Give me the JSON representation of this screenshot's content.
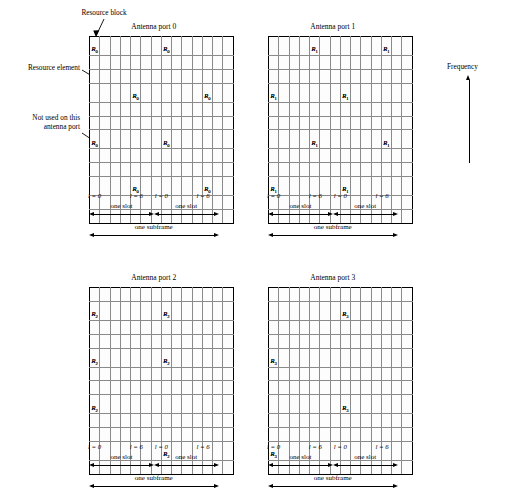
{
  "figure": {
    "type": "lte-resource-grid",
    "panel_count": 4,
    "grid": {
      "columns": 14,
      "rows": 12,
      "slots_per_subframe": 2,
      "symbols_per_slot": 7,
      "subcarriers": 12
    }
  },
  "annotations": {
    "resource_block": "Resource block",
    "resource_element": "Resource element",
    "not_used_line1": "Not used on this",
    "not_used_line2": "antenna port",
    "frequency": "Frequency"
  },
  "axis": {
    "l_zero": "l = 0",
    "l_six": "l = 6",
    "one_slot": "one slot",
    "one_subframe": "one subframe"
  },
  "colors": {
    "grid_line": "#8a8a8a",
    "border": "#000000",
    "hatch_fill": "#e9e9e9",
    "ref_fill": "#d8d8d8"
  },
  "panels": [
    {
      "id": "antenna-port-0",
      "title": "Antenna port 0",
      "ref_symbol": "R",
      "ref_subscript": "0",
      "cells": {
        "ref": [
          {
            "row": 2,
            "col": 0
          },
          {
            "row": 2,
            "col": 4
          },
          {
            "row": 2,
            "col": 7
          },
          {
            "row": 2,
            "col": 11
          },
          {
            "row": 5,
            "col": 0
          },
          {
            "row": 5,
            "col": 4
          },
          {
            "row": 5,
            "col": 7
          },
          {
            "row": 5,
            "col": 11
          },
          {
            "row": 8,
            "col": 0
          },
          {
            "row": 8,
            "col": 4
          },
          {
            "row": 8,
            "col": 7
          },
          {
            "row": 8,
            "col": 11
          },
          {
            "row": 11,
            "col": 0
          },
          {
            "row": 11,
            "col": 4
          },
          {
            "row": 11,
            "col": 7
          },
          {
            "row": 11,
            "col": 11
          }
        ],
        "ref_labeled": [
          {
            "row": 2,
            "col": 4
          },
          {
            "row": 2,
            "col": 11
          },
          {
            "row": 5,
            "col": 0
          },
          {
            "row": 5,
            "col": 7
          },
          {
            "row": 8,
            "col": 4
          },
          {
            "row": 8,
            "col": 11
          },
          {
            "row": 11,
            "col": 0
          },
          {
            "row": 11,
            "col": 7
          }
        ]
      }
    },
    {
      "id": "antenna-port-1",
      "title": "Antenna port 1",
      "ref_symbol": "R",
      "ref_subscript": "1",
      "cells": {
        "ref": [
          {
            "row": 2,
            "col": 0
          },
          {
            "row": 2,
            "col": 4
          },
          {
            "row": 2,
            "col": 7
          },
          {
            "row": 2,
            "col": 11
          },
          {
            "row": 5,
            "col": 0
          },
          {
            "row": 5,
            "col": 4
          },
          {
            "row": 5,
            "col": 7
          },
          {
            "row": 5,
            "col": 11
          },
          {
            "row": 8,
            "col": 0
          },
          {
            "row": 8,
            "col": 4
          },
          {
            "row": 8,
            "col": 7
          },
          {
            "row": 8,
            "col": 11
          },
          {
            "row": 11,
            "col": 0
          },
          {
            "row": 11,
            "col": 4
          },
          {
            "row": 11,
            "col": 7
          },
          {
            "row": 11,
            "col": 11
          }
        ],
        "ref_labeled": [
          {
            "row": 2,
            "col": 0
          },
          {
            "row": 2,
            "col": 7
          },
          {
            "row": 5,
            "col": 4
          },
          {
            "row": 5,
            "col": 11
          },
          {
            "row": 8,
            "col": 0
          },
          {
            "row": 8,
            "col": 7
          },
          {
            "row": 11,
            "col": 4
          },
          {
            "row": 11,
            "col": 11
          }
        ]
      }
    },
    {
      "id": "antenna-port-2",
      "title": "Antenna port 2",
      "ref_symbol": "R",
      "ref_subscript": "2",
      "cells": {
        "ref": [
          {
            "row": 1,
            "col": 0
          },
          {
            "row": 1,
            "col": 4
          },
          {
            "row": 1,
            "col": 7
          },
          {
            "row": 1,
            "col": 11
          },
          {
            "row": 4,
            "col": 0
          },
          {
            "row": 4,
            "col": 4
          },
          {
            "row": 4,
            "col": 7
          },
          {
            "row": 4,
            "col": 11
          },
          {
            "row": 7,
            "col": 0
          },
          {
            "row": 7,
            "col": 4
          },
          {
            "row": 7,
            "col": 7
          },
          {
            "row": 7,
            "col": 11
          },
          {
            "row": 10,
            "col": 0
          },
          {
            "row": 10,
            "col": 4
          },
          {
            "row": 10,
            "col": 7
          },
          {
            "row": 10,
            "col": 11
          }
        ],
        "ref_labeled": [
          {
            "row": 1,
            "col": 7
          },
          {
            "row": 4,
            "col": 0
          },
          {
            "row": 7,
            "col": 0
          },
          {
            "row": 7,
            "col": 7
          },
          {
            "row": 10,
            "col": 0
          },
          {
            "row": 10,
            "col": 7
          }
        ]
      }
    },
    {
      "id": "antenna-port-3",
      "title": "Antenna port 3",
      "ref_symbol": "R",
      "ref_subscript": "3",
      "cells": {
        "ref": [
          {
            "row": 1,
            "col": 0
          },
          {
            "row": 1,
            "col": 4
          },
          {
            "row": 1,
            "col": 7
          },
          {
            "row": 1,
            "col": 11
          },
          {
            "row": 4,
            "col": 0
          },
          {
            "row": 4,
            "col": 4
          },
          {
            "row": 4,
            "col": 7
          },
          {
            "row": 4,
            "col": 11
          },
          {
            "row": 7,
            "col": 0
          },
          {
            "row": 7,
            "col": 4
          },
          {
            "row": 7,
            "col": 7
          },
          {
            "row": 7,
            "col": 11
          },
          {
            "row": 10,
            "col": 0
          },
          {
            "row": 10,
            "col": 4
          },
          {
            "row": 10,
            "col": 7
          },
          {
            "row": 10,
            "col": 11
          }
        ],
        "ref_labeled": [
          {
            "row": 1,
            "col": 0
          },
          {
            "row": 4,
            "col": 7
          },
          {
            "row": 7,
            "col": 0
          },
          {
            "row": 10,
            "col": 7
          }
        ]
      }
    }
  ]
}
